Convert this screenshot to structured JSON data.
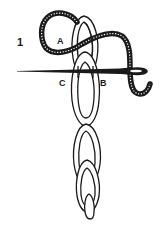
{
  "figure": {
    "step_number": "1",
    "labels": {
      "a": "A",
      "b": "B",
      "c": "C"
    },
    "colors": {
      "ink": "#1a1a1a",
      "background": "#ffffff"
    },
    "chain_links": 4
  }
}
